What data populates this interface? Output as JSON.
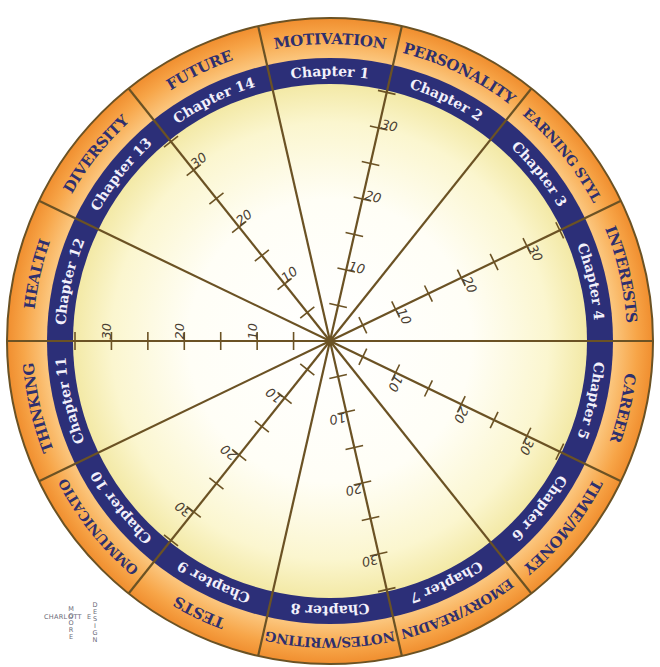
{
  "diagram": {
    "sectors": [
      {
        "category": "MOTIVATION",
        "chapter": "Chapter 1"
      },
      {
        "category": "PERSONALITY",
        "chapter": "Chapter 2"
      },
      {
        "category": "LEARNING STYLE",
        "chapter": "Chapter 3"
      },
      {
        "category": "INTERESTS",
        "chapter": "Chapter 4"
      },
      {
        "category": "CAREER",
        "chapter": "Chapter 5"
      },
      {
        "category": "TIME/MONEY",
        "chapter": "Chapter 6"
      },
      {
        "category": "MEMORY/READING",
        "chapter": "Chapter 7"
      },
      {
        "category": "NOTES/WRITING",
        "chapter": "Chapter 8"
      },
      {
        "category": "TESTS",
        "chapter": "Chapter 9"
      },
      {
        "category": "COMMUNICATION",
        "chapter": "Chapter 10"
      },
      {
        "category": "THINKING",
        "chapter": "Chapter 11"
      },
      {
        "category": "HEALTH",
        "chapter": "Chapter 12"
      },
      {
        "category": "DIVERSITY",
        "chapter": "Chapter 13"
      },
      {
        "category": "FUTURE",
        "chapter": "Chapter 14"
      }
    ],
    "scale": {
      "min": 0,
      "max": 35,
      "tick_step": 5,
      "labels": [
        "10",
        "20",
        "30"
      ],
      "scaled_boundaries_after_chapter": [
        1,
        3,
        5,
        7,
        9,
        11,
        13
      ]
    },
    "colors": {
      "outer_ring": "#f59a3c",
      "outer_ring_light": "#fbc57c",
      "chapter_band": "#2c2f78",
      "category_text": "#2e2f6e",
      "chapter_text": "#f2f0fb",
      "spoke": "#6b5224",
      "center_light": "#ffffff",
      "center_edge": "#f6eeae"
    }
  },
  "credit": {
    "first": "CHARL",
    "shared": "OTT",
    "last": "E",
    "middle_vertical": "MOORE",
    "right_vertical": "DESIGN"
  }
}
